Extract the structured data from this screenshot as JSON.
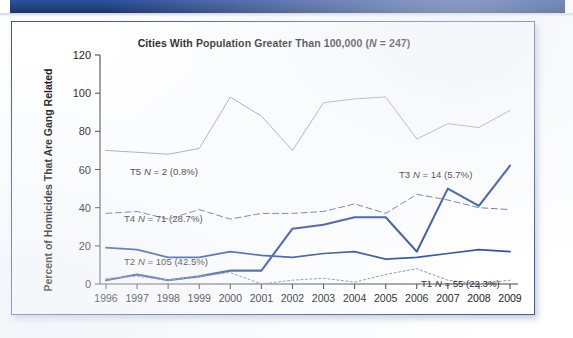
{
  "figure": {
    "banner_color": "#23417f",
    "border_color": "#3a5ca8"
  },
  "chart_data": {
    "type": "line",
    "title": "Cities With Population Greater Than 100,000 (N = 247)",
    "xlabel": "",
    "ylabel": "Percent of Homicides That Are Gang Related",
    "ylim": [
      0,
      120
    ],
    "yticks": [
      0,
      20,
      40,
      60,
      80,
      100,
      120
    ],
    "grid": false,
    "legend_position": "inline-annotations",
    "categories": [
      "1996",
      "1997",
      "1998",
      "1999",
      "2000",
      "2001",
      "2002",
      "2003",
      "2004",
      "2005",
      "2006",
      "2007",
      "2008",
      "2009"
    ],
    "x": [
      1996,
      1997,
      1998,
      1999,
      2000,
      2001,
      2002,
      2003,
      2004,
      2005,
      2006,
      2007,
      2008,
      2009
    ],
    "series": [
      {
        "name": "T5",
        "label": "T5 N = 2 (0.8%)",
        "n": 2,
        "percent": "0.8%",
        "color": "#8a9ec4",
        "style": "thin-solid-light",
        "values": [
          70,
          69,
          68,
          71,
          98,
          88,
          70,
          95,
          97,
          98,
          76,
          84,
          82,
          91
        ]
      },
      {
        "name": "T4",
        "label": "T4 N = 71 (28.7%)",
        "n": 71,
        "percent": "28.7%",
        "color": "#5b73ac",
        "style": "dashed",
        "values": [
          37,
          38,
          34,
          39,
          34,
          37,
          37,
          38,
          42,
          37,
          47,
          44,
          40,
          39
        ]
      },
      {
        "name": "T3",
        "label": "T3 N = 14 (5.7%)",
        "n": 14,
        "percent": "5.7%",
        "color": "#2b4ea2",
        "style": "thick-solid",
        "values": [
          2,
          5,
          2,
          4,
          7,
          7,
          29,
          31,
          35,
          35,
          17,
          50,
          41,
          62
        ]
      },
      {
        "name": "T2",
        "label": "T2 N = 105 (42.5%)",
        "n": 105,
        "percent": "42.5%",
        "color": "#2b4ea2",
        "style": "medium-solid",
        "values": [
          19,
          18,
          14,
          14,
          17,
          15,
          14,
          16,
          17,
          13,
          14,
          16,
          18,
          17
        ]
      },
      {
        "name": "T1",
        "label": "T1 N = 55 (22.3%)",
        "n": 55,
        "percent": "22.3%",
        "color": "#7d8fbb",
        "style": "dotted",
        "values": [
          3,
          4,
          2,
          4,
          6,
          0,
          2,
          3,
          1,
          5,
          8,
          2,
          0,
          2
        ]
      }
    ],
    "annotations": [
      {
        "text": "T5 N = 2 (0.8%)",
        "x_px": 118,
        "y_px": 153
      },
      {
        "text": "T4 N = 71 (28.7%)",
        "x_px": 112,
        "y_px": 200
      },
      {
        "text": "T2 N = 105 (42.5%)",
        "x_px": 112,
        "y_px": 243
      },
      {
        "text": "T3 N = 14 (5.7%)",
        "x_px": 387,
        "y_px": 156
      },
      {
        "text": "T1 N = 55 (22.3%)",
        "x_px": 409,
        "y_px": 265
      }
    ]
  }
}
